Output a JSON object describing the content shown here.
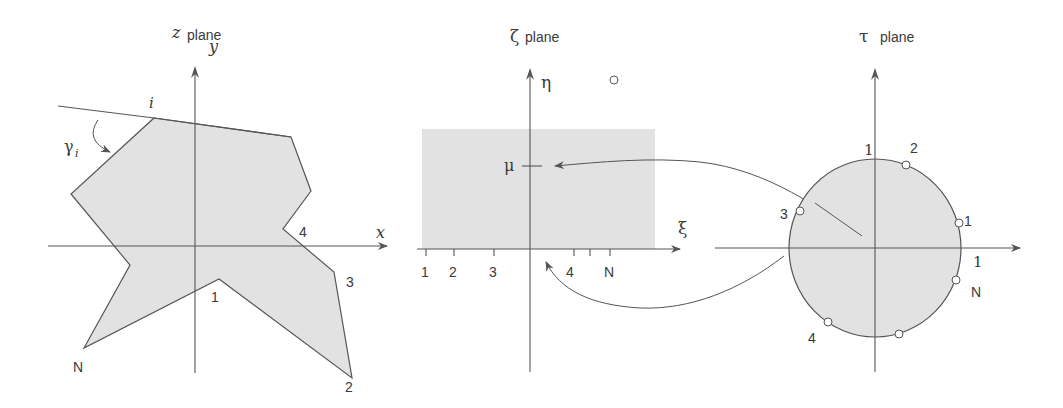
{
  "panels": {
    "z_plane": {
      "title_symbol": "z",
      "title_word": "plane",
      "axis_x_label": "x",
      "axis_y_label": "y",
      "vertex_labels": [
        "1",
        "2",
        "3",
        "4",
        "N"
      ],
      "angle_vertex_label": "i",
      "angle_label": "γ",
      "angle_subscript": "i"
    },
    "zeta_plane": {
      "title_symbol": "ζ",
      "title_word": "plane",
      "axis_x_label": "ξ",
      "axis_y_label": "η",
      "mu_label": "μ",
      "tick_labels": [
        "1",
        "2",
        "3",
        "4",
        "N"
      ]
    },
    "tau_plane": {
      "title_symbol": "τ",
      "title_word": "plane",
      "unit_label_top": "1",
      "unit_label_right": "1",
      "vertex_labels": [
        "1",
        "2",
        "3",
        "4",
        "N"
      ]
    }
  },
  "colors": {
    "fill": "#e2e2e2",
    "stroke": "#555555",
    "text": "#3a3a3a"
  }
}
